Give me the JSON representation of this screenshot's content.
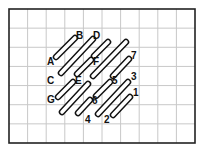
{
  "diagram": {
    "type": "stitch-grid",
    "grid": {
      "x0": 9,
      "y0": 9,
      "x1": 195,
      "y1": 143,
      "columns": 10,
      "rows": 7,
      "border_color": "#222222",
      "line_color": "#c8c8c8"
    },
    "stitch_style": {
      "stroke": "#111111",
      "width": 6.5,
      "inner": "#ffffff",
      "inner_width": 3.6
    },
    "stitches": [
      {
        "x1": 56,
        "y1": 57,
        "x2": 75,
        "y2": 38
      },
      {
        "x1": 61,
        "y1": 73,
        "x2": 93,
        "y2": 39
      },
      {
        "x1": 94,
        "y1": 56,
        "x2": 108,
        "y2": 42
      },
      {
        "x1": 93,
        "y1": 76,
        "x2": 126,
        "y2": 42
      },
      {
        "x1": 77,
        "y1": 74,
        "x2": 91,
        "y2": 60
      },
      {
        "x1": 58,
        "y1": 97,
        "x2": 73,
        "y2": 82
      },
      {
        "x1": 62,
        "y1": 112,
        "x2": 88,
        "y2": 84
      },
      {
        "x1": 113,
        "y1": 76,
        "x2": 129,
        "y2": 59
      },
      {
        "x1": 96,
        "y1": 96,
        "x2": 110,
        "y2": 82
      },
      {
        "x1": 78,
        "y1": 113,
        "x2": 90,
        "y2": 100
      },
      {
        "x1": 98,
        "y1": 114,
        "x2": 128,
        "y2": 82
      },
      {
        "x1": 113,
        "y1": 115,
        "x2": 130,
        "y2": 97
      }
    ],
    "labels": [
      {
        "text": "A",
        "x": 47,
        "y": 65
      },
      {
        "text": "B",
        "x": 76,
        "y": 39
      },
      {
        "text": "C",
        "x": 47,
        "y": 84
      },
      {
        "text": "D",
        "x": 93,
        "y": 39
      },
      {
        "text": "E",
        "x": 75,
        "y": 84
      },
      {
        "text": "F",
        "x": 93,
        "y": 65
      },
      {
        "text": "G",
        "x": 47,
        "y": 103
      },
      {
        "text": "7",
        "x": 131,
        "y": 59
      },
      {
        "text": "5",
        "x": 112,
        "y": 84
      },
      {
        "text": "3",
        "x": 131,
        "y": 80
      },
      {
        "text": "6",
        "x": 92,
        "y": 104
      },
      {
        "text": "1",
        "x": 133,
        "y": 96
      },
      {
        "text": "4",
        "x": 85,
        "y": 123
      },
      {
        "text": "2",
        "x": 104,
        "y": 123
      }
    ]
  }
}
